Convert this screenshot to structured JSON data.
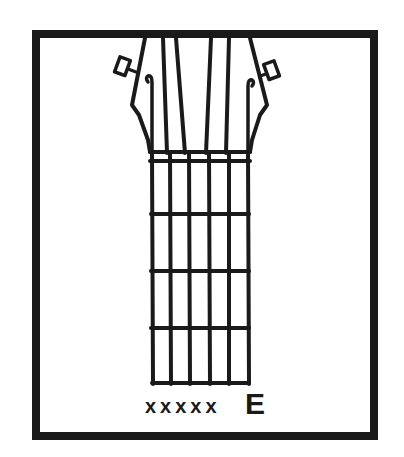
{
  "diagram": {
    "type": "guitar-chord-chart",
    "strings": 6,
    "frets_shown": 5,
    "string_markers": [
      "x",
      "x",
      "x",
      "x",
      "x",
      "E"
    ],
    "mute_label": "xxxxx",
    "open_label": "E"
  }
}
